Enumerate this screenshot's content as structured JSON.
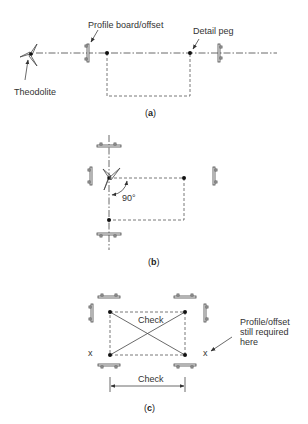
{
  "figure_a": {
    "label_profile": "Profile board/offset",
    "label_detail_peg": "Detail peg",
    "label_theodolite": "Theodolite",
    "caption_open": "(",
    "caption_letter": "a",
    "caption_close": ")"
  },
  "figure_b": {
    "angle_label": "90°",
    "caption_open": "(",
    "caption_letter": "b",
    "caption_close": ")"
  },
  "figure_c": {
    "check_diagonal_label": "Check",
    "check_dimension_label": "Check",
    "note_line1": "Profile/offset",
    "note_line2": "still required",
    "note_line3": "here",
    "x_mark_left": "x",
    "x_mark_right": "x",
    "caption_open": "(",
    "caption_letter": "c",
    "caption_close": ")"
  }
}
